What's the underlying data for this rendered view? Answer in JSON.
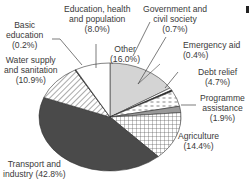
{
  "chart_data": {
    "type": "pie",
    "title": "",
    "categories": [
      "Other",
      "Government and civil society",
      "Emergency aid",
      "Debt relief",
      "Programme assistance",
      "Agriculture",
      "Transport and industry",
      "Water supply and sanitation",
      "Basic education",
      "Education, health and population"
    ],
    "values": [
      16.0,
      0.7,
      0.4,
      4.7,
      1.9,
      14.4,
      42.8,
      10.9,
      0.2,
      8.0
    ],
    "unit": "%",
    "legend": "none (direct labels)",
    "slices": [
      {
        "name": "Other",
        "value": 16.0,
        "label": "Other\n(16.0%)",
        "fill": "#d4d4d4",
        "pattern": "solid-light-grey"
      },
      {
        "name": "Government and civil society",
        "value": 0.7,
        "label": "Government and\ncivil society\n(0.7%)",
        "fill": "#ffffff",
        "pattern": "white"
      },
      {
        "name": "Emergency aid",
        "value": 0.4,
        "label": "Emergency aid\n(0.4%)",
        "fill": "#222222",
        "pattern": "solid-black"
      },
      {
        "name": "Debt relief",
        "value": 4.7,
        "label": "Debt relief\n(4.7%)",
        "fill": "#ffffff",
        "pattern": "dashes"
      },
      {
        "name": "Programme assistance",
        "value": 1.9,
        "label": "Programme\nassistance\n(1.9%)",
        "fill": "#9a9a9a",
        "pattern": "solid-mid-grey"
      },
      {
        "name": "Agriculture",
        "value": 14.4,
        "label": "Agriculture\n(14.4%)",
        "fill": "#ffffff",
        "pattern": "grid"
      },
      {
        "name": "Transport and industry",
        "value": 42.8,
        "label": "Transport and\nindustry (42.8%)",
        "fill": "#4a4a4a",
        "pattern": "solid-dark-grey"
      },
      {
        "name": "Water supply and sanitation",
        "value": 10.9,
        "label": "Water supply\nand sanitation\n(10.9%)",
        "fill": "#ffffff",
        "pattern": "diagonal-hatch"
      },
      {
        "name": "Basic education",
        "value": 0.2,
        "label": "Basic\neducation\n(0.2%)",
        "fill": "#222222",
        "pattern": "solid-black"
      },
      {
        "name": "Education, health and population",
        "value": 8.0,
        "label": "Education, health\nand population\n(8.0%)",
        "fill": "#ffffff",
        "pattern": "white"
      }
    ]
  },
  "labels": {
    "education_health": [
      "Education, health",
      "and population",
      "(8.0%)"
    ],
    "government": [
      "Government and",
      "civil society",
      "(0.7%)"
    ],
    "basic_education": [
      "Basic",
      "education",
      "(0.2%)"
    ],
    "water_supply": [
      "Water supply",
      "and sanitation",
      "(10.9%)"
    ],
    "other": [
      "Other",
      "(16.0%)"
    ],
    "emergency_aid": [
      "Emergency aid",
      "(0.4%)"
    ],
    "debt_relief": [
      "Debt relief",
      "(4.7%)"
    ],
    "programme_assistance": [
      "Programme",
      "assistance",
      "(1.9%)"
    ],
    "agriculture": [
      "Agriculture",
      "(14.4%)"
    ],
    "transport": [
      "Transport and",
      "industry (42.8%)"
    ]
  }
}
